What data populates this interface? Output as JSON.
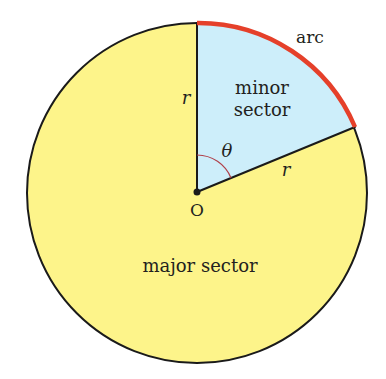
{
  "diagram": {
    "center_label": "O",
    "radius_label": "r",
    "angle_label": "θ",
    "minor_sector_line1": "minor",
    "minor_sector_line2": "sector",
    "major_sector_label": "major sector",
    "arc_label": "arc",
    "colors": {
      "major_fill": "#fdf48a",
      "minor_fill": "#cdeefa",
      "arc": "#e5402a",
      "outline": "#1a1a1a",
      "angle_mark": "#b0404a"
    },
    "geometry": {
      "center": [
        197,
        192
      ],
      "radius": 170,
      "sector_angle_deg_from_vertical": 67.5
    }
  }
}
